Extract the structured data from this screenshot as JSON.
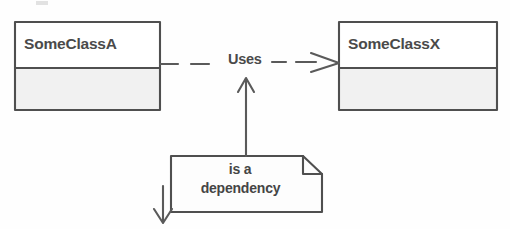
{
  "diagram": {
    "type": "uml-class-diagram",
    "background_color": "#fefefe",
    "stroke_color": "#4a4a4a",
    "compartment_fill": "#f2f2f2",
    "header_fill": "#ffffff"
  },
  "classes": [
    {
      "id": "SomeClassA",
      "name": "SomeClassA",
      "role": "client",
      "attributes": [],
      "operations": [],
      "compartments": 2
    },
    {
      "id": "SomeClassX",
      "name": "SomeClassX",
      "role": "supplier",
      "attributes": [],
      "operations": [],
      "compartments": 2
    }
  ],
  "relationship": {
    "kind": "dependency",
    "label": "Uses",
    "line_style": "dashed",
    "arrow_head": "open",
    "source": "SomeClassA",
    "target": "SomeClassX"
  },
  "note": {
    "line1": "is a",
    "line2": "dependency",
    "text": "is a dependency",
    "shape": "folded-corner-note",
    "anchor_arrows": [
      "up-to-relationship",
      "down-left"
    ]
  },
  "icons": {
    "arrow_up": "arrow-up-icon",
    "arrow_down": "arrow-down-icon",
    "open_arrow_head": "open-arrowhead-icon",
    "folded_corner": "folded-corner-icon"
  }
}
